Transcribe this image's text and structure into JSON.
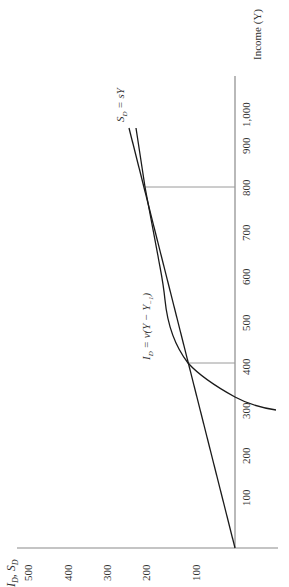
{
  "chart_data": {
    "type": "line",
    "orientation": "rotated-90-ccw",
    "title": "",
    "xlabel": "Income (Y)",
    "ylabel": "I_D, S_D",
    "x_ticks": [
      "100",
      "200",
      "300",
      "400",
      "500",
      "600",
      "700",
      "800",
      "900",
      "1,000"
    ],
    "y_ticks": [
      "100",
      "200",
      "300",
      "400",
      "500"
    ],
    "xlim": [
      0,
      1050
    ],
    "ylim": [
      -100,
      500
    ],
    "grid": false,
    "series": [
      {
        "name": "S_D = sY",
        "x": [
          0,
          200,
          400,
          600,
          800,
          1000
        ],
        "values": [
          0,
          50,
          100,
          150,
          200,
          250
        ]
      },
      {
        "name": "I_D = v(Y − Y_-1)",
        "x": [
          290,
          310,
          350,
          400,
          450,
          500,
          550,
          600,
          700,
          800,
          950
        ],
        "values": [
          -85,
          0,
          60,
          100,
          125,
          140,
          152,
          162,
          180,
          200,
          235
        ]
      }
    ],
    "annotations": [
      {
        "type": "guide",
        "x": 400,
        "y": 100
      },
      {
        "type": "guide",
        "x": 800,
        "y": 200
      }
    ]
  },
  "labels": {
    "income_axis": "Income (Y)",
    "is_axis": "I",
    "is_axis_sub": "D",
    "is_axis_sep": ", S",
    "is_axis_sub2": "D",
    "sd_label": "S",
    "sd_sub": "D",
    "sd_rest": " = sY",
    "id_label": "I",
    "id_sub": "D",
    "id_rest": " = v(Y − Y",
    "id_sub2": "−1",
    "id_end": ")"
  },
  "income_ticks": [
    {
      "label": "100",
      "y": 497
    },
    {
      "label": "200",
      "y": 455
    },
    {
      "label": "300",
      "y": 410
    },
    {
      "label": "400",
      "y": 366
    },
    {
      "label": "500",
      "y": 322
    },
    {
      "label": "600",
      "y": 276
    },
    {
      "label": "700",
      "y": 232
    },
    {
      "label": "800",
      "y": 187
    },
    {
      "label": "900",
      "y": 145
    },
    {
      "label": "1,000",
      "y": 112
    }
  ],
  "is_ticks": [
    {
      "label": "100",
      "x": 196
    },
    {
      "label": "200",
      "x": 146
    },
    {
      "label": "300",
      "x": 107
    },
    {
      "label": "400",
      "x": 68
    },
    {
      "label": "500",
      "x": 28
    }
  ]
}
